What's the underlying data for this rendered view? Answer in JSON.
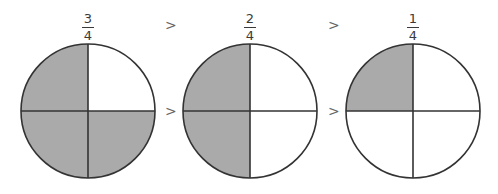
{
  "diagram": {
    "colors": {
      "shaded": "#aaaaaa",
      "unshaded": "#ffffff",
      "stroke": "#333333"
    },
    "fractions": [
      {
        "numerator": "3",
        "denominator": "4",
        "shaded_quadrants": [
          "top-left",
          "bottom-left",
          "bottom-right"
        ]
      },
      {
        "numerator": "2",
        "denominator": "4",
        "shaded_quadrants": [
          "top-left",
          "bottom-left"
        ]
      },
      {
        "numerator": "1",
        "denominator": "4",
        "shaded_quadrants": [
          "top-left"
        ]
      }
    ],
    "comparison_symbols": [
      ">",
      ">"
    ]
  }
}
